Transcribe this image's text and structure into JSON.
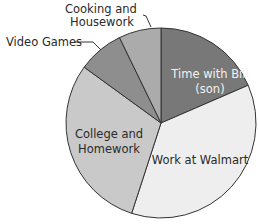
{
  "chart_data": {
    "type": "pie",
    "title": "",
    "start_angle_deg": 0,
    "direction": "clockwise",
    "slices": [
      {
        "label": "Time with Bill (son)",
        "value": 18.5,
        "color": "#787878",
        "label_lines": [
          "Time with Bill",
          "(son)"
        ],
        "label_color": "#f2f2f2"
      },
      {
        "label": "Work at Walmart",
        "value": 36.5,
        "color": "#eeeeee",
        "label_lines": [
          "Work at Walmart"
        ],
        "label_color": "#2a2a2a"
      },
      {
        "label": "College and Homework",
        "value": 30.0,
        "color": "#c9c9c9",
        "label_lines": [
          "College and",
          "Homework"
        ],
        "label_color": "#2a2a2a"
      },
      {
        "label": "Video Games",
        "value": 7.8,
        "color": "#8e8e8e",
        "label_lines": [
          "Video Games"
        ],
        "label_color": "#2a2a2a",
        "external": true
      },
      {
        "label": "Cooking and Housework",
        "value": 7.2,
        "color": "#ababab",
        "label_lines": [
          "Cooking and",
          "Housework"
        ],
        "label_color": "#2a2a2a",
        "external": true
      }
    ],
    "legend": "none (labels placed on/near slices)",
    "units": "percent of time (approx.)"
  },
  "labels": {
    "time_with_bill_1": "Time with Bill",
    "time_with_bill_2": "(son)",
    "walmart": "Work at Walmart",
    "college_1": "College and",
    "college_2": "Homework",
    "video_games": "Video Games",
    "cooking_1": "Cooking and",
    "cooking_2": "Housework"
  }
}
